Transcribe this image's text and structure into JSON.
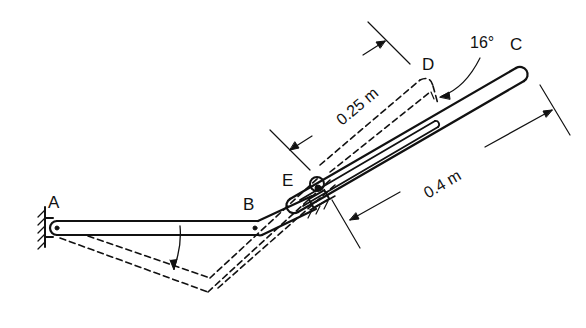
{
  "diagram": {
    "type": "mechanism",
    "points": {
      "A": {
        "label": "A"
      },
      "B": {
        "label": "B"
      },
      "C": {
        "label": "C"
      },
      "D": {
        "label": "D"
      },
      "E": {
        "label": "E"
      }
    },
    "dimensions": {
      "ed": "0.25 m",
      "ec": "0.4 m",
      "angle": "16°"
    },
    "colors": {
      "ink": "#111111",
      "background": "#ffffff"
    }
  }
}
